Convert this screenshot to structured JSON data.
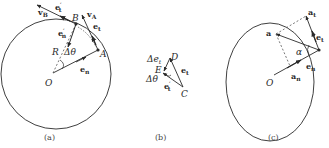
{
  "panels": [
    {
      "id": "a",
      "caption": "(a)",
      "labels": {
        "vB": "v",
        "vB_sub": "B",
        "et_prime": "e",
        "et_prime_sub": "t",
        "et_prime_sup": "′",
        "B": "B",
        "vA": "v",
        "vA_sub": "A",
        "et": "e",
        "et_sub": "t",
        "en_prime": "e",
        "en_prime_sub": "n",
        "en_prime_sup": "′",
        "R": "R",
        "dtheta": "Δθ",
        "A": "A",
        "en": "e",
        "en_sub": "n",
        "O": "O"
      }
    },
    {
      "id": "b",
      "caption": "(b)",
      "labels": {
        "de": "Δe",
        "de_sub": "t",
        "D": "D",
        "E": "E",
        "et": "e",
        "et_sub": "t",
        "dtheta": "Δθ",
        "et_prime": "e",
        "et_prime_sub": "t",
        "et_prime_sup": "′",
        "C": "C"
      }
    },
    {
      "id": "c",
      "caption": "(c)",
      "labels": {
        "at": "a",
        "at_sub": "t",
        "a": "a",
        "et": "e",
        "et_sub": "t",
        "alpha": "α",
        "en": "e",
        "en_sub": "n",
        "an": "a",
        "an_sub": "n",
        "O": "O"
      }
    }
  ],
  "colors": {
    "stroke": "#2a2a2a",
    "dashed": "#555555"
  }
}
